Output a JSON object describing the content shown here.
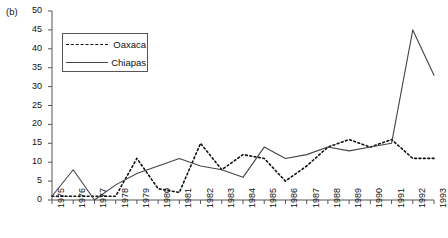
{
  "panel": {
    "label": "(b)"
  },
  "legend": {
    "entries": [
      {
        "name": "Oaxaca",
        "style": "dashed",
        "color": "#111111"
      },
      {
        "name": "Chiapas",
        "style": "solid",
        "color": "#444444"
      }
    ]
  },
  "axes": {
    "y_ticks": [
      "0",
      "5",
      "10",
      "15",
      "20",
      "25",
      "30",
      "35",
      "40",
      "45",
      "50"
    ],
    "x_ticks": [
      "1975",
      "1976",
      "1977",
      "1978",
      "1979",
      "1980",
      "1981",
      "1982",
      "1983",
      "1984",
      "1985",
      "1986",
      "1987",
      "1988",
      "1989",
      "1990",
      "1991",
      "1992",
      "1993"
    ]
  },
  "chart_data": {
    "type": "line",
    "title": "",
    "xlabel": "",
    "ylabel": "",
    "xlim": [
      1975,
      1993
    ],
    "ylim": [
      0,
      50
    ],
    "grid": false,
    "legend_position": "top-left",
    "x": [
      1975,
      1976,
      1977,
      1978,
      1979,
      1980,
      1981,
      1982,
      1983,
      1984,
      1985,
      1986,
      1987,
      1988,
      1989,
      1990,
      1991,
      1992,
      1993
    ],
    "series": [
      {
        "name": "Oaxaca",
        "style": "dashed",
        "color": "#111111",
        "values": [
          1,
          1,
          1,
          1,
          11,
          3,
          2,
          15,
          8,
          12,
          11,
          5,
          9,
          14,
          16,
          14,
          16,
          11,
          11
        ]
      },
      {
        "name": "Chiapas",
        "style": "solid",
        "color": "#444444",
        "values": [
          1,
          8,
          0,
          4,
          7,
          9,
          11,
          9,
          8,
          6,
          14,
          11,
          12,
          14,
          13,
          14,
          15,
          45,
          33
        ]
      }
    ]
  }
}
